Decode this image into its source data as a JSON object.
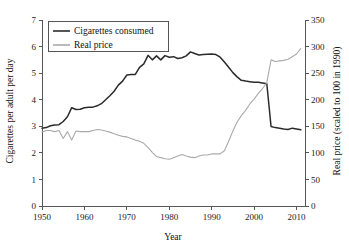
{
  "chart_data": {
    "type": "line",
    "title": "",
    "xlabel": "Year",
    "ylabel": "Cigarettes per adult per day",
    "y2label": "Real price (scaled to 100 in 1990)",
    "xlim": [
      1950,
      2012
    ],
    "ylim": [
      0,
      7
    ],
    "y2lim": [
      0,
      350
    ],
    "grid": false,
    "legend_position": "top-left",
    "xticks": [
      1950,
      1960,
      1970,
      1980,
      1990,
      2000,
      2010
    ],
    "xtick_labels": [
      "1950",
      "1960",
      "1970",
      "1980",
      "1990",
      "2000",
      "2010"
    ],
    "yticks": [
      0,
      1,
      2,
      3,
      4,
      5,
      6,
      7
    ],
    "ytick_labels": [
      "0",
      "1",
      "2",
      "3",
      "4",
      "5",
      "6",
      "7"
    ],
    "y2ticks": [
      0,
      50,
      100,
      150,
      200,
      250,
      300,
      350
    ],
    "y2tick_labels": [
      "0",
      "50",
      "100",
      "150",
      "200",
      "250",
      "300",
      "350"
    ],
    "x": [
      1950,
      1951,
      1952,
      1953,
      1954,
      1955,
      1956,
      1957,
      1958,
      1959,
      1960,
      1961,
      1962,
      1963,
      1964,
      1965,
      1966,
      1967,
      1968,
      1969,
      1970,
      1971,
      1972,
      1973,
      1974,
      1975,
      1976,
      1977,
      1978,
      1979,
      1980,
      1981,
      1982,
      1983,
      1984,
      1985,
      1986,
      1987,
      1988,
      1989,
      1990,
      1991,
      1992,
      1993,
      1994,
      1995,
      1996,
      1997,
      1998,
      1999,
      2000,
      2001,
      2002,
      2003,
      2004,
      2005,
      2006,
      2007,
      2008,
      2009,
      2010,
      2011
    ],
    "series": [
      {
        "name": "Cigarettes consumed",
        "axis": "left",
        "color": "#2b2b2b",
        "values": [
          2.93,
          2.95,
          3.02,
          3.05,
          3.06,
          3.18,
          3.36,
          3.7,
          3.63,
          3.64,
          3.7,
          3.72,
          3.72,
          3.77,
          3.85,
          4.0,
          4.15,
          4.32,
          4.55,
          4.7,
          4.93,
          4.95,
          4.95,
          5.22,
          5.35,
          5.67,
          5.5,
          5.65,
          5.5,
          5.66,
          5.6,
          5.62,
          5.55,
          5.58,
          5.65,
          5.8,
          5.74,
          5.68,
          5.7,
          5.71,
          5.72,
          5.7,
          5.6,
          5.42,
          5.22,
          5.02,
          4.86,
          4.73,
          4.7,
          4.68,
          4.66,
          4.66,
          4.63,
          4.6,
          2.99,
          2.95,
          2.93,
          2.9,
          2.88,
          2.93,
          2.9,
          2.87
        ]
      },
      {
        "name": "Real price",
        "axis": "right",
        "color": "#aaaaaa",
        "values": [
          139,
          142,
          142,
          140,
          142,
          127,
          140,
          124,
          141,
          140,
          140,
          140,
          142,
          144,
          143,
          141,
          139,
          136,
          133,
          131,
          130,
          127,
          124,
          122,
          118,
          110,
          101,
          93,
          91,
          89,
          88,
          91,
          94,
          97,
          94,
          92,
          91,
          94,
          96,
          96,
          98,
          98,
          98,
          104,
          122,
          141,
          158,
          170,
          180,
          192,
          201,
          212,
          221,
          232,
          275,
          272,
          273,
          274,
          276,
          281,
          286,
          296
        ]
      }
    ]
  },
  "legend": {
    "items": [
      {
        "label": "Cigarettes consumed",
        "color": "#2b2b2b"
      },
      {
        "label": "Real price",
        "color": "#aaaaaa"
      }
    ]
  },
  "axes": {
    "left_title": "Cigarettes per adult per day",
    "right_title": "Real price (scaled to 100 in 1990)",
    "bottom_title": "Year"
  }
}
